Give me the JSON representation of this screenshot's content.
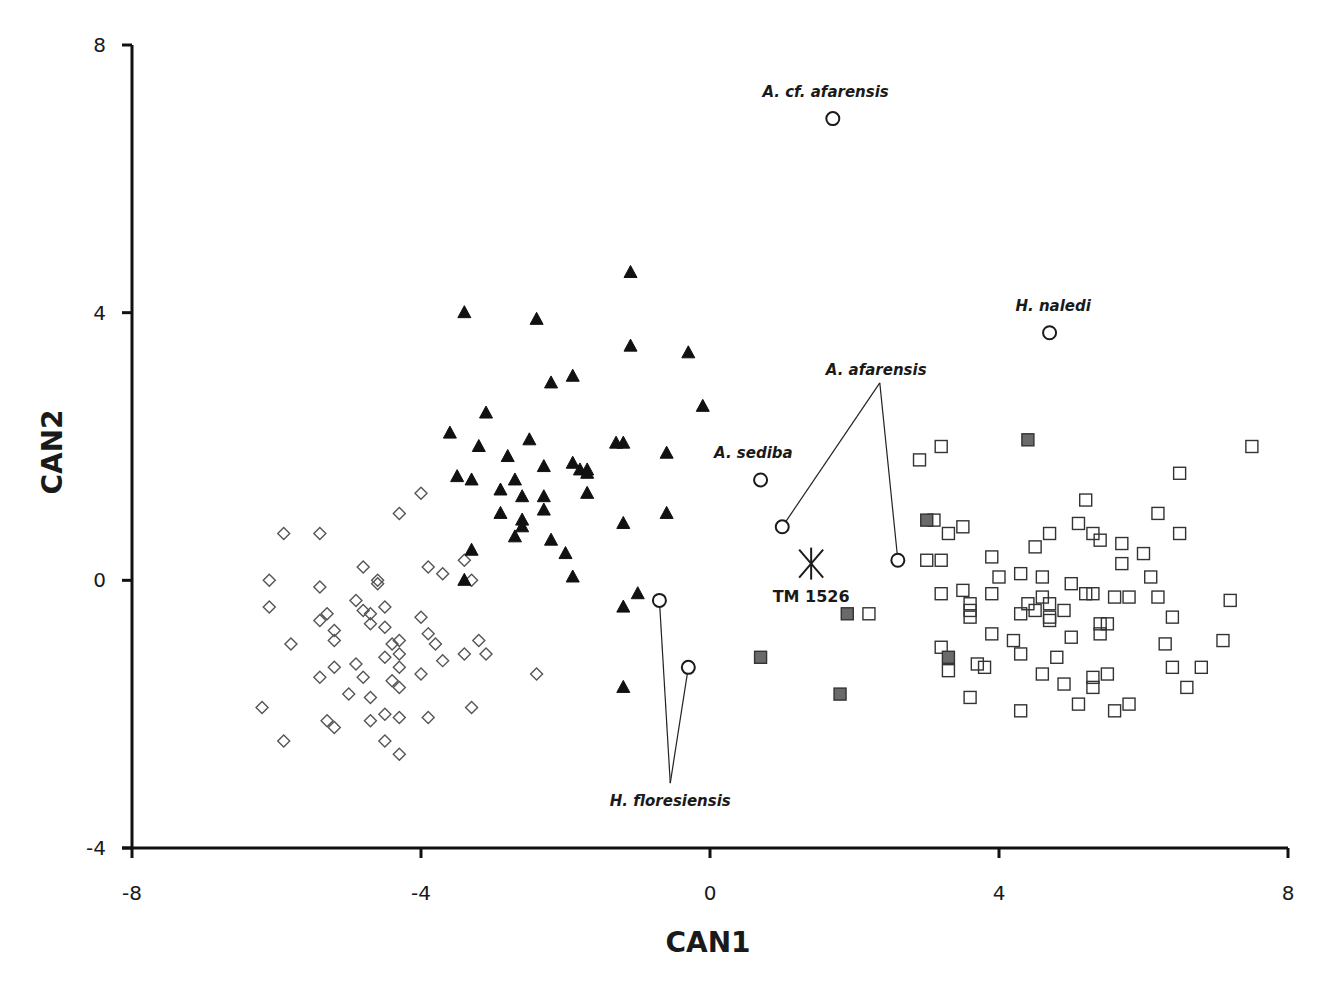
{
  "chart_data": {
    "type": "scatter",
    "title": "",
    "xlabel": "CAN1",
    "ylabel": "CAN2",
    "xlim": [
      -8,
      8
    ],
    "ylim": [
      -4,
      8
    ],
    "xticks": [
      "-8",
      "-4",
      "0",
      "4",
      "8"
    ],
    "yticks": [
      "8",
      "4",
      "0",
      "-4"
    ],
    "grid": false,
    "legend": null,
    "series": [
      {
        "name": "open-diamonds",
        "marker": "diamond-open",
        "color": "#555555",
        "points": [
          [
            -4.0,
            1.3
          ],
          [
            -4.3,
            1.0
          ],
          [
            -5.9,
            0.7
          ],
          [
            -5.4,
            0.7
          ],
          [
            -4.8,
            0.2
          ],
          [
            -3.9,
            0.2
          ],
          [
            -3.7,
            0.1
          ],
          [
            -3.4,
            0.3
          ],
          [
            -6.1,
            0.0
          ],
          [
            -5.4,
            -0.1
          ],
          [
            -4.6,
            0.0
          ],
          [
            -4.6,
            -0.05
          ],
          [
            -3.3,
            0.0
          ],
          [
            -6.1,
            -0.4
          ],
          [
            -4.9,
            -0.3
          ],
          [
            -4.5,
            -0.4
          ],
          [
            -5.3,
            -0.5
          ],
          [
            -5.4,
            -0.6
          ],
          [
            -4.8,
            -0.45
          ],
          [
            -4.7,
            -0.5
          ],
          [
            -4.7,
            -0.65
          ],
          [
            -4.5,
            -0.7
          ],
          [
            -4.0,
            -0.55
          ],
          [
            -5.2,
            -0.75
          ],
          [
            -5.2,
            -0.9
          ],
          [
            -5.8,
            -0.95
          ],
          [
            -4.4,
            -0.95
          ],
          [
            -4.3,
            -0.9
          ],
          [
            -4.3,
            -1.1
          ],
          [
            -4.5,
            -1.15
          ],
          [
            -3.9,
            -0.8
          ],
          [
            -3.8,
            -0.95
          ],
          [
            -3.7,
            -1.2
          ],
          [
            -3.2,
            -0.9
          ],
          [
            -3.4,
            -1.1
          ],
          [
            -3.1,
            -1.1
          ],
          [
            -5.2,
            -1.3
          ],
          [
            -5.4,
            -1.45
          ],
          [
            -4.9,
            -1.25
          ],
          [
            -4.8,
            -1.45
          ],
          [
            -4.3,
            -1.3
          ],
          [
            -4.4,
            -1.5
          ],
          [
            -4.3,
            -1.6
          ],
          [
            -4.0,
            -1.4
          ],
          [
            -5.0,
            -1.7
          ],
          [
            -4.7,
            -1.75
          ],
          [
            -6.2,
            -1.9
          ],
          [
            -5.3,
            -2.1
          ],
          [
            -5.2,
            -2.2
          ],
          [
            -4.7,
            -2.1
          ],
          [
            -4.5,
            -2.0
          ],
          [
            -4.3,
            -2.05
          ],
          [
            -3.9,
            -2.05
          ],
          [
            -3.3,
            -1.9
          ],
          [
            -5.9,
            -2.4
          ],
          [
            -4.5,
            -2.4
          ],
          [
            -4.3,
            -2.6
          ],
          [
            -2.4,
            -1.4
          ]
        ]
      },
      {
        "name": "filled-triangles",
        "marker": "triangle-filled",
        "color": "#111111",
        "points": [
          [
            -1.1,
            4.6
          ],
          [
            -3.4,
            4.0
          ],
          [
            -2.4,
            3.9
          ],
          [
            -1.1,
            3.5
          ],
          [
            -0.3,
            3.4
          ],
          [
            -1.9,
            3.05
          ],
          [
            -2.2,
            2.95
          ],
          [
            -3.1,
            2.5
          ],
          [
            -0.1,
            2.6
          ],
          [
            -3.6,
            2.2
          ],
          [
            -3.2,
            2.0
          ],
          [
            -2.5,
            2.1
          ],
          [
            -1.3,
            2.05
          ],
          [
            -1.2,
            2.05
          ],
          [
            -0.6,
            1.9
          ],
          [
            -2.8,
            1.85
          ],
          [
            -2.3,
            1.7
          ],
          [
            -1.9,
            1.75
          ],
          [
            -1.8,
            1.65
          ],
          [
            -1.7,
            1.65
          ],
          [
            -1.7,
            1.6
          ],
          [
            -3.5,
            1.55
          ],
          [
            -3.3,
            1.5
          ],
          [
            -2.7,
            1.5
          ],
          [
            -2.9,
            1.35
          ],
          [
            -2.6,
            1.25
          ],
          [
            -2.3,
            1.25
          ],
          [
            -1.7,
            1.3
          ],
          [
            -2.3,
            1.05
          ],
          [
            -2.9,
            1.0
          ],
          [
            -2.6,
            0.9
          ],
          [
            -2.6,
            0.8
          ],
          [
            -2.7,
            0.65
          ],
          [
            -2.2,
            0.6
          ],
          [
            -1.2,
            0.85
          ],
          [
            -0.6,
            1.0
          ],
          [
            -3.3,
            0.45
          ],
          [
            -2.0,
            0.4
          ],
          [
            -1.9,
            0.05
          ],
          [
            -3.4,
            0.0
          ],
          [
            -1.0,
            -0.2
          ],
          [
            -1.2,
            -0.4
          ],
          [
            -1.2,
            -1.6
          ]
        ]
      },
      {
        "name": "open-squares",
        "marker": "square-open",
        "color": "#333333",
        "points": [
          [
            2.2,
            -0.5
          ],
          [
            3.2,
            2.0
          ],
          [
            2.9,
            1.8
          ],
          [
            7.5,
            2.0
          ],
          [
            6.5,
            1.6
          ],
          [
            5.2,
            1.2
          ],
          [
            6.2,
            1.0
          ],
          [
            3.1,
            0.9
          ],
          [
            3.3,
            0.7
          ],
          [
            3.5,
            0.8
          ],
          [
            4.7,
            0.7
          ],
          [
            5.1,
            0.85
          ],
          [
            5.3,
            0.7
          ],
          [
            5.4,
            0.6
          ],
          [
            5.7,
            0.55
          ],
          [
            6.5,
            0.7
          ],
          [
            4.5,
            0.5
          ],
          [
            6.0,
            0.4
          ],
          [
            3.0,
            0.3
          ],
          [
            3.2,
            0.3
          ],
          [
            3.9,
            0.35
          ],
          [
            5.7,
            0.25
          ],
          [
            4.0,
            0.05
          ],
          [
            4.3,
            0.1
          ],
          [
            4.6,
            0.05
          ],
          [
            6.1,
            0.05
          ],
          [
            5.0,
            -0.05
          ],
          [
            3.2,
            -0.2
          ],
          [
            3.5,
            -0.15
          ],
          [
            3.9,
            -0.2
          ],
          [
            3.6,
            -0.35
          ],
          [
            3.6,
            -0.45
          ],
          [
            3.6,
            -0.55
          ],
          [
            4.4,
            -0.35
          ],
          [
            4.6,
            -0.25
          ],
          [
            4.7,
            -0.35
          ],
          [
            4.9,
            -0.45
          ],
          [
            4.5,
            -0.45
          ],
          [
            4.3,
            -0.5
          ],
          [
            4.7,
            -0.55
          ],
          [
            4.7,
            -0.6
          ],
          [
            5.2,
            -0.2
          ],
          [
            5.3,
            -0.2
          ],
          [
            5.6,
            -0.25
          ],
          [
            5.8,
            -0.25
          ],
          [
            6.2,
            -0.25
          ],
          [
            7.2,
            -0.3
          ],
          [
            6.4,
            -0.55
          ],
          [
            5.4,
            -0.65
          ],
          [
            5.5,
            -0.65
          ],
          [
            5.4,
            -0.8
          ],
          [
            3.9,
            -0.8
          ],
          [
            5.0,
            -0.85
          ],
          [
            6.3,
            -0.95
          ],
          [
            7.1,
            -0.9
          ],
          [
            3.2,
            -1.0
          ],
          [
            4.2,
            -0.9
          ],
          [
            4.3,
            -1.1
          ],
          [
            4.8,
            -1.15
          ],
          [
            3.3,
            -1.35
          ],
          [
            3.7,
            -1.25
          ],
          [
            3.8,
            -1.3
          ],
          [
            4.6,
            -1.4
          ],
          [
            6.4,
            -1.3
          ],
          [
            6.8,
            -1.3
          ],
          [
            5.3,
            -1.45
          ],
          [
            5.5,
            -1.4
          ],
          [
            4.9,
            -1.55
          ],
          [
            5.3,
            -1.6
          ],
          [
            6.6,
            -1.6
          ],
          [
            3.6,
            -1.75
          ],
          [
            5.1,
            -1.85
          ],
          [
            5.8,
            -1.85
          ],
          [
            5.6,
            -1.95
          ],
          [
            4.3,
            -1.95
          ]
        ]
      },
      {
        "name": "gray-filled-squares",
        "marker": "square-filled",
        "color": "#6a6a6a",
        "points": [
          [
            4.4,
            2.1
          ],
          [
            3.0,
            0.9
          ],
          [
            1.9,
            -0.5
          ],
          [
            0.7,
            -1.15
          ],
          [
            1.8,
            -1.7
          ],
          [
            3.3,
            -1.15
          ]
        ]
      },
      {
        "name": "fossil-specimens",
        "marker": "circle-open",
        "color": "#1a1a1a",
        "points": [
          [
            1.7,
            6.9
          ],
          [
            4.7,
            3.7
          ],
          [
            0.7,
            1.5
          ],
          [
            1.0,
            0.8
          ],
          [
            2.6,
            0.3
          ],
          [
            -0.7,
            -0.3
          ],
          [
            -0.3,
            -1.3
          ]
        ]
      },
      {
        "name": "TM 1526",
        "marker": "asterisk",
        "color": "#1a1a1a",
        "points": [
          [
            1.4,
            0.25
          ]
        ]
      }
    ],
    "annotations": [
      {
        "text": "A. cf. afarensis",
        "x": 1.6,
        "y": 7.3,
        "points": [
          [
            1.7,
            6.9
          ]
        ],
        "leader": false
      },
      {
        "text": "H. naledi",
        "x": 4.75,
        "y": 4.1,
        "points": [
          [
            4.7,
            3.7
          ]
        ],
        "leader": false
      },
      {
        "text": "A. sediba",
        "x": 0.6,
        "y": 1.9,
        "points": [
          [
            0.7,
            1.5
          ]
        ],
        "leader": false
      },
      {
        "text": "A. afarensis",
        "x": 2.3,
        "y": 3.15,
        "points": [
          [
            1.0,
            0.8
          ],
          [
            2.6,
            0.3
          ]
        ],
        "leader": true,
        "leader_origin": [
          2.35,
          2.95
        ]
      },
      {
        "text": "H. floresiensis",
        "x": -0.55,
        "y": -3.3,
        "points": [
          [
            -0.7,
            -0.3
          ],
          [
            -0.3,
            -1.3
          ]
        ],
        "leader": true,
        "leader_origin": [
          -0.55,
          -3.03
        ]
      },
      {
        "text": "TM 1526",
        "x": 1.4,
        "y": -0.25,
        "points": [
          [
            1.4,
            0.25
          ]
        ],
        "leader": false,
        "italic": false
      }
    ]
  }
}
